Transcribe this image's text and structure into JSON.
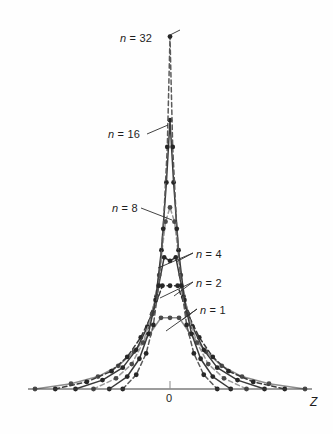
{
  "figure": {
    "background_color": "#fefefe",
    "axis_color": "#3a3a3a",
    "width": 333,
    "height": 434
  },
  "axis": {
    "origin_label": "0",
    "x_axis_label": "Z",
    "axis_y_pixel": 389,
    "origin_x_pixel": 170
  },
  "annotations": [
    {
      "id": "n32",
      "n_symbol": "n",
      "equals_value": "= 32",
      "full_text": "n = 32",
      "x": 120,
      "y": 33
    },
    {
      "id": "n16",
      "n_symbol": "n",
      "equals_value": "= 16",
      "full_text": "n = 16",
      "x": 108,
      "y": 129
    },
    {
      "id": "n8",
      "n_symbol": "n",
      "equals_value": "= 8",
      "full_text": "n = 8",
      "x": 112,
      "y": 203
    },
    {
      "id": "n4",
      "n_symbol": "n",
      "equals_value": "= 4",
      "full_text": "n = 4",
      "x": 196,
      "y": 249
    },
    {
      "id": "n2",
      "n_symbol": "n",
      "equals_value": "= 2",
      "full_text": "n = 2",
      "x": 196,
      "y": 278
    },
    {
      "id": "n1",
      "n_symbol": "n",
      "equals_value": "= 1",
      "full_text": "n = 1",
      "x": 200,
      "y": 305
    }
  ],
  "chart_data": {
    "type": "line",
    "title": "",
    "subtitle": "",
    "xlabel": "Z",
    "ylabel": "",
    "xlim": [
      -3.2,
      3.2
    ],
    "ylim": [
      0,
      1.0
    ],
    "grid": false,
    "legend": "inline-annotations",
    "x_tick_labels": [
      "0"
    ],
    "x_tick_values": [
      0
    ],
    "y_tick_labels": [],
    "note": "Sampling distributions of Z for increasing sample size n; peaks grow taller and narrower as n increases.",
    "series": [
      {
        "name": "n = 1",
        "n": 1,
        "style": "solid",
        "color": "#8e8e8e",
        "marker": "circle",
        "x": [
          -3.0,
          -2.2,
          -1.6,
          -1.15,
          -0.8,
          -0.45,
          -0.2,
          0.0,
          0.2,
          0.45,
          0.8,
          1.15,
          1.6,
          2.2,
          3.0
        ],
        "y": [
          0.0,
          0.015,
          0.035,
          0.065,
          0.105,
          0.155,
          0.2,
          0.2,
          0.2,
          0.155,
          0.105,
          0.065,
          0.035,
          0.015,
          0.0
        ]
      },
      {
        "name": "n = 2",
        "n": 2,
        "style": "dashed",
        "color": "#3a3a3a",
        "marker": "circle",
        "x": [
          -2.55,
          -1.85,
          -1.3,
          -0.95,
          -0.65,
          -0.38,
          -0.17,
          0.0,
          0.17,
          0.38,
          0.65,
          0.95,
          1.3,
          1.85,
          2.55
        ],
        "y": [
          0.0,
          0.02,
          0.05,
          0.09,
          0.145,
          0.215,
          0.29,
          0.29,
          0.29,
          0.215,
          0.145,
          0.09,
          0.05,
          0.02,
          0.0
        ]
      },
      {
        "name": "n = 4",
        "n": 4,
        "style": "solid",
        "color": "#3a3a3a",
        "marker": "circle",
        "x": [
          -2.1,
          -1.5,
          -1.05,
          -0.75,
          -0.5,
          -0.3,
          -0.13,
          0.0,
          0.13,
          0.3,
          0.5,
          0.75,
          1.05,
          1.5,
          2.1
        ],
        "y": [
          0.0,
          0.025,
          0.06,
          0.11,
          0.175,
          0.26,
          0.37,
          0.36,
          0.37,
          0.26,
          0.175,
          0.11,
          0.06,
          0.025,
          0.0
        ]
      },
      {
        "name": "n = 8",
        "n": 8,
        "style": "dashed",
        "color": "#9a9a9a",
        "marker": "circle",
        "x": [
          -1.7,
          -1.2,
          -0.85,
          -0.6,
          -0.4,
          -0.24,
          -0.1,
          0.0,
          0.1,
          0.24,
          0.4,
          0.6,
          0.85,
          1.2,
          1.7
        ],
        "y": [
          0.0,
          0.03,
          0.07,
          0.13,
          0.21,
          0.32,
          0.47,
          0.51,
          0.47,
          0.32,
          0.21,
          0.13,
          0.07,
          0.03,
          0.0
        ]
      },
      {
        "name": "n = 16",
        "n": 16,
        "style": "solid",
        "color": "#3a3a3a",
        "marker": "circle",
        "x": [
          -1.35,
          -0.95,
          -0.68,
          -0.48,
          -0.32,
          -0.19,
          -0.08,
          0.0,
          0.08,
          0.19,
          0.32,
          0.48,
          0.68,
          0.95,
          1.35
        ],
        "y": [
          0.0,
          0.035,
          0.085,
          0.155,
          0.25,
          0.39,
          0.58,
          0.755,
          0.58,
          0.39,
          0.25,
          0.155,
          0.085,
          0.035,
          0.0
        ]
      },
      {
        "name": "n = 32",
        "n": 32,
        "style": "dashed",
        "color": "#5a5a5a",
        "marker": "circle",
        "x": [
          -1.05,
          -0.75,
          -0.53,
          -0.37,
          -0.25,
          -0.15,
          -0.06,
          0.0,
          0.06,
          0.15,
          0.25,
          0.37,
          0.53,
          0.75,
          1.05
        ],
        "y": [
          0.0,
          0.04,
          0.1,
          0.18,
          0.29,
          0.45,
          0.68,
          0.99,
          0.68,
          0.45,
          0.29,
          0.18,
          0.1,
          0.04,
          0.0
        ]
      }
    ]
  }
}
